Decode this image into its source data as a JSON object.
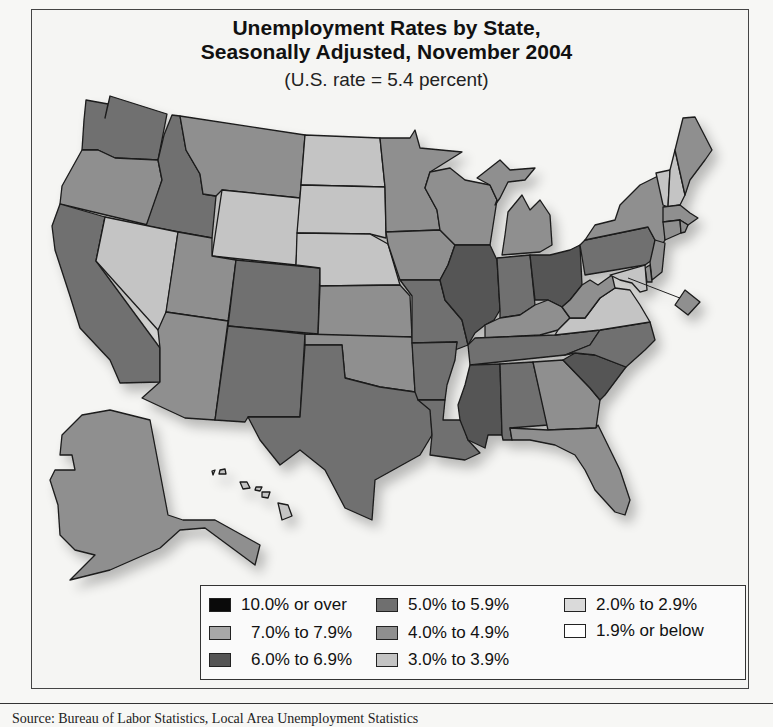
{
  "map": {
    "title_line1": "Unemployment Rates by State,",
    "title_line2": "Seasonally Adjusted, November 2004",
    "subtitle": "(U.S. rate = 5.4 percent)",
    "us_rate_percent": 5.4,
    "source_text_partial": "Source: Bureau of Labor Statistics, Local Area Unemployment Statistics"
  },
  "legend": {
    "items": [
      {
        "key": "c10",
        "label": "10.0% or over",
        "color": "#0a0a0a"
      },
      {
        "key": "c7",
        "label": "7.0% to 7.9%",
        "color": "#a8a8a8"
      },
      {
        "key": "c6",
        "label": "6.0% to 6.9%",
        "color": "#555555"
      },
      {
        "key": "c5",
        "label": "5.0% to 5.9%",
        "color": "#6f6f6f"
      },
      {
        "key": "c4",
        "label": "4.0% to 4.9%",
        "color": "#8f8f8f"
      },
      {
        "key": "c3",
        "label": "3.0% to 3.9%",
        "color": "#c4c4c4"
      },
      {
        "key": "c2",
        "label": "2.0% to 2.9%",
        "color": "#dadada"
      },
      {
        "key": "c1",
        "label": "1.9% or below",
        "color": "#ffffff"
      }
    ]
  },
  "states": {
    "WA": "c5",
    "OR": "c4",
    "CA": "c5",
    "ID": "c5",
    "NV": "c3",
    "MT": "c4",
    "WY": "c3",
    "UT": "c4",
    "AZ": "c4",
    "CO": "c5",
    "NM": "c5",
    "ND": "c3",
    "SD": "c3",
    "NE": "c3",
    "KS": "c4",
    "OK": "c4",
    "TX": "c5",
    "MN": "c4",
    "IA": "c4",
    "MO": "c5",
    "AR": "c5",
    "LA": "c5",
    "WI": "c4",
    "IL": "c6",
    "MI": "c4",
    "IN": "c5",
    "OH": "c6",
    "KY": "c4",
    "TN": "c5",
    "MS": "c6",
    "AL": "c5",
    "GA": "c4",
    "FL": "c4",
    "SC": "c6",
    "NC": "c5",
    "VA": "c3",
    "WV": "c4",
    "PA": "c5",
    "NY": "c4",
    "VT": "c3",
    "NH": "c3",
    "ME": "c4",
    "MA": "c4",
    "RI": "c4",
    "CT": "c4",
    "NJ": "c4",
    "DE": "c4",
    "MD": "c3",
    "DC": "c4",
    "AK": "c4",
    "HI": "c3"
  }
}
